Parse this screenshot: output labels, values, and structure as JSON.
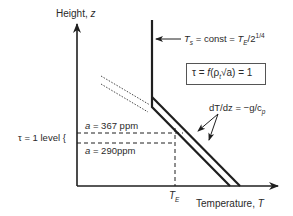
{
  "diagram": {
    "axes": {
      "y_label": "Height, ",
      "y_var": "z",
      "x_label": "Temperature, ",
      "x_var": "T"
    },
    "annotations": {
      "surface_temp": {
        "T": "T",
        "sub_s": "s",
        "mid": " = const = ",
        "T2": "T",
        "sub_E": "E",
        "tail": "/2",
        "sup": "1/4"
      },
      "tau_box": {
        "lhs": "τ = ",
        "f": "f",
        "arg_open": "(ρ",
        "sub_t": "t",
        "sqrt": "√a",
        "arg_close": ") = 1"
      },
      "lapse_rate": {
        "text": "dT/dz = −g/c",
        "sub_p": "p"
      },
      "tau_level": "τ = 1 level {",
      "a_367": {
        "var": "a",
        "value": " = 367 ppm"
      },
      "a_290": {
        "var": "a",
        "value": " = 290ppm"
      },
      "TE": {
        "T": "T",
        "sub": "E"
      }
    },
    "colors": {
      "line": "#1f1f1f",
      "text": "#2a2a2a",
      "background": "#ffffff"
    }
  }
}
